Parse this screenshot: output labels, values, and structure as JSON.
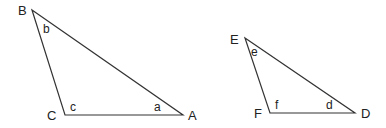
{
  "triangles": [
    {
      "name": "triangle-abc",
      "vertices": [
        {
          "label": "B",
          "x": 32,
          "y": 10,
          "lx": 18,
          "ly": 15
        },
        {
          "label": "C",
          "x": 65,
          "y": 115,
          "lx": 47,
          "ly": 120
        },
        {
          "label": "A",
          "x": 183,
          "y": 115,
          "lx": 188,
          "ly": 120
        }
      ],
      "angles": [
        {
          "label": "b",
          "x": 43,
          "y": 33
        },
        {
          "label": "c",
          "x": 70,
          "y": 111
        },
        {
          "label": "a",
          "x": 154,
          "y": 111
        }
      ]
    },
    {
      "name": "triangle-def",
      "vertices": [
        {
          "label": "E",
          "x": 245,
          "y": 38,
          "lx": 230,
          "ly": 44
        },
        {
          "label": "F",
          "x": 270,
          "y": 113,
          "lx": 254,
          "ly": 118
        },
        {
          "label": "D",
          "x": 355,
          "y": 113,
          "lx": 361,
          "ly": 118
        }
      ],
      "angles": [
        {
          "label": "e",
          "x": 251,
          "y": 56
        },
        {
          "label": "f",
          "x": 275,
          "y": 109
        },
        {
          "label": "d",
          "x": 326,
          "y": 109
        }
      ]
    }
  ]
}
